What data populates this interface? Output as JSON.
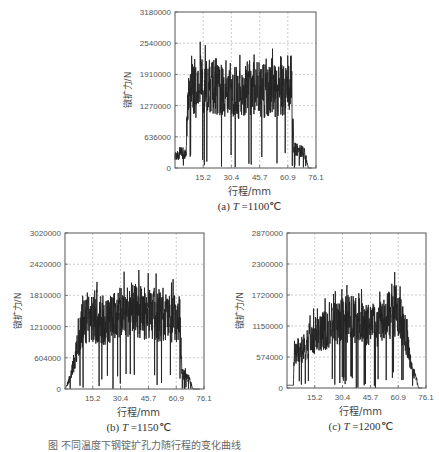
{
  "figure_caption": "图  不同温度下钢锭扩孔力随行程的变化曲线",
  "chart_data": [
    {
      "type": "line",
      "id": "a",
      "subtitle_prefix": "(a) ",
      "subtitle_var": "T",
      "subtitle_value": " =1100℃",
      "xlabel": "行程/mm",
      "ylabel": "镦扩力/N",
      "xlim": [
        0,
        76.1
      ],
      "ylim": [
        0,
        3180000
      ],
      "xticks": [
        "15.2",
        "30.4",
        "45.7",
        "60.9",
        "76.1"
      ],
      "yticks": [
        "0",
        "636000",
        "1270000",
        "1910000",
        "2540000",
        "3180000"
      ],
      "grid": true,
      "envelope": {
        "x": [
          0,
          6,
          7,
          8,
          9,
          10,
          15,
          20,
          25,
          30,
          35,
          40,
          45,
          50,
          55,
          60,
          62,
          63,
          64,
          68,
          70,
          72
        ],
        "y": [
          250000,
          280000,
          1400000,
          1600000,
          1700000,
          1550000,
          1650000,
          1700000,
          1600000,
          1550000,
          1500000,
          1650000,
          1600000,
          1550000,
          1550000,
          1600000,
          1750000,
          1800000,
          400000,
          350000,
          300000,
          0
        ]
      },
      "box": {
        "left": 175,
        "top": 12,
        "right": 316,
        "bottom": 168
      }
    },
    {
      "type": "line",
      "id": "b",
      "subtitle_prefix": "(b) ",
      "subtitle_var": "T",
      "subtitle_value": " =1150℃",
      "xlabel": "行程/mm",
      "ylabel": "镦扩力/N",
      "xlim": [
        0,
        76.1
      ],
      "ylim": [
        0,
        3020000
      ],
      "xticks": [
        "15.2",
        "30.4",
        "45.7",
        "60.9",
        "76.1"
      ],
      "yticks": [
        "0",
        "604000",
        "1210000",
        "1810000",
        "2420000",
        "3020000"
      ],
      "grid": true,
      "envelope": {
        "x": [
          0,
          2,
          5,
          8,
          10,
          15,
          20,
          25,
          30,
          35,
          40,
          45,
          50,
          55,
          60,
          63,
          64,
          68,
          70
        ],
        "y": [
          0,
          150000,
          500000,
          1000000,
          1300000,
          1350000,
          1250000,
          1350000,
          1450000,
          1550000,
          1500000,
          1450000,
          1400000,
          1400000,
          1350000,
          1150000,
          300000,
          200000,
          0
        ]
      },
      "box": {
        "left": 65,
        "top": 233,
        "right": 204,
        "bottom": 389
      }
    },
    {
      "type": "line",
      "id": "c",
      "subtitle_prefix": "(c) ",
      "subtitle_var": "T",
      "subtitle_value": " =1200℃",
      "xlabel": "行程/mm",
      "ylabel": "镦扩力/N",
      "xlim": [
        0,
        76.1
      ],
      "ylim": [
        0,
        2870000
      ],
      "xticks": [
        "15.2",
        "30.4",
        "45.7",
        "60.9",
        "76.1"
      ],
      "yticks": [
        "0",
        "574000",
        "1150000",
        "1720000",
        "2300000",
        "2870000"
      ],
      "grid": true,
      "envelope": {
        "x": [
          0,
          3.5,
          4,
          8,
          12,
          16,
          20,
          25,
          30,
          35,
          40,
          45,
          50,
          55,
          58,
          62,
          64,
          66,
          68,
          71,
          72
        ],
        "y": [
          50000,
          50000,
          650000,
          700000,
          850000,
          1000000,
          1050000,
          1150000,
          1250000,
          1300000,
          1250000,
          1200000,
          1150000,
          1300000,
          1500000,
          1300000,
          1100000,
          800000,
          400000,
          150000,
          0
        ]
      },
      "box": {
        "left": 287,
        "top": 233,
        "right": 426,
        "bottom": 388
      }
    }
  ]
}
